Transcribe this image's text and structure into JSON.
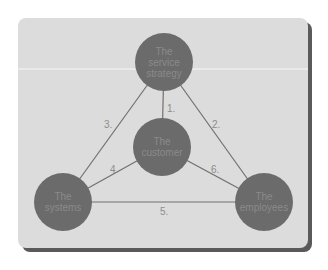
{
  "diagram": {
    "colors": {
      "panel_bg": "#dcdcdc",
      "panel_shadow": "#5a5a5a",
      "node_fill": "#6b6b6b",
      "node_text": "#8a8a8a",
      "edge_stroke": "#707070",
      "label_text": "#8c8c8c"
    },
    "nodes": [
      {
        "id": "service-strategy",
        "lines": [
          "The",
          "service",
          "strategy"
        ],
        "cx": 164,
        "cy": 62,
        "r": 29
      },
      {
        "id": "customer",
        "lines": [
          "The",
          "customer"
        ],
        "cx": 162,
        "cy": 147,
        "r": 29
      },
      {
        "id": "systems",
        "lines": [
          "The",
          "systems"
        ],
        "cx": 63,
        "cy": 202,
        "r": 29
      },
      {
        "id": "employees",
        "lines": [
          "The",
          "employees"
        ],
        "cx": 264,
        "cy": 202,
        "r": 29
      }
    ],
    "edges": [
      {
        "label": "1.",
        "from": "service-strategy",
        "to": "customer",
        "lx": 167,
        "ly": 112
      },
      {
        "label": "2.",
        "from": "service-strategy",
        "to": "employees",
        "lx": 212,
        "ly": 128
      },
      {
        "label": "3.",
        "from": "service-strategy",
        "to": "systems",
        "lx": 104,
        "ly": 128
      },
      {
        "label": "4.",
        "from": "customer",
        "to": "systems",
        "lx": 110,
        "ly": 173
      },
      {
        "label": "5.",
        "from": "systems",
        "to": "employees",
        "lx": 160,
        "ly": 215
      },
      {
        "label": "6.",
        "from": "customer",
        "to": "employees",
        "lx": 211,
        "ly": 173
      }
    ]
  }
}
